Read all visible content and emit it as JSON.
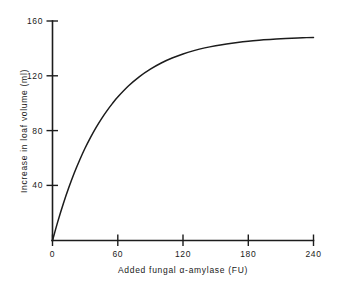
{
  "chart_data": {
    "type": "line",
    "title": "",
    "xlabel": "Added fungal α-amylase (FU)",
    "ylabel": "Increase in loaf volume (ml)",
    "xlim": [
      0,
      240
    ],
    "ylim": [
      0,
      160
    ],
    "xticks": [
      0,
      60,
      120,
      180,
      240
    ],
    "yticks": [
      0,
      40,
      80,
      120,
      160
    ],
    "xtick_labels": [
      "0",
      "60",
      "120",
      "180",
      "240"
    ],
    "ytick_labels": [
      "",
      "40",
      "80",
      "120",
      "160"
    ],
    "grid": false,
    "legend": null,
    "series": [
      {
        "name": "Increase in loaf volume",
        "color": "#1c1c1c",
        "x": [
          0,
          5,
          10,
          15,
          20,
          25,
          30,
          35,
          40,
          45,
          50,
          55,
          60,
          70,
          80,
          90,
          100,
          110,
          120,
          130,
          140,
          150,
          160,
          170,
          180,
          190,
          200,
          210,
          220,
          230,
          240
        ],
        "y": [
          0,
          14.1,
          27.0,
          38.6,
          49.2,
          58.7,
          67.4,
          75.2,
          82.3,
          88.7,
          94.5,
          99.8,
          104.6,
          112.8,
          119.5,
          124.9,
          129.4,
          133.0,
          136.0,
          138.4,
          140.4,
          142.0,
          143.3,
          144.4,
          145.3,
          146.0,
          146.6,
          147.1,
          147.5,
          147.8,
          148.0
        ]
      }
    ]
  },
  "axis_labels": {
    "x_title": "Added fungal α-amylase (FU)",
    "y_title": "Increase in loaf volume (ml)",
    "x_tick_0": "0",
    "x_tick_1": "60",
    "x_tick_2": "120",
    "x_tick_3": "180",
    "x_tick_4": "240",
    "y_tick_1": "40",
    "y_tick_2": "80",
    "y_tick_3": "120",
    "y_tick_4": "160"
  },
  "colors": {
    "curve": "#1c1c1c",
    "axis": "#1c1c1c",
    "background": "#ffffff",
    "text": "#1a1a1a"
  }
}
